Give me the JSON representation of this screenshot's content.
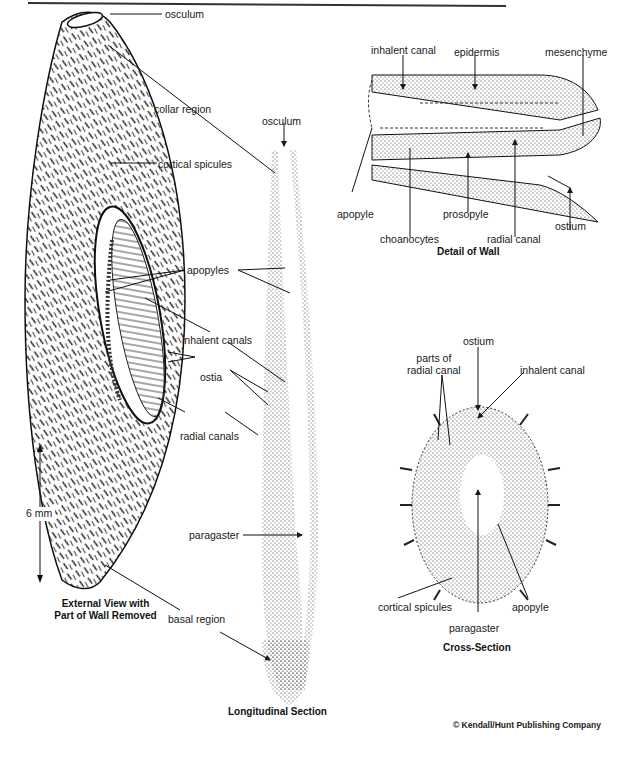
{
  "figure": {
    "panels": [
      {
        "id": "external-view",
        "caption_line1": "External View with",
        "caption_line2": "Part of Wall Removed",
        "scale_bar": "6 mm",
        "labels": [
          "osculum",
          "collar region",
          "cortical spicules",
          "apopyles",
          "inhalent canals",
          "ostia",
          "radial canals",
          "basal region"
        ]
      },
      {
        "id": "longitudinal-section",
        "caption": "Longitudinal Section",
        "labels": [
          "osculum",
          "paragaster"
        ]
      },
      {
        "id": "detail-of-wall",
        "caption": "Detail of Wall",
        "labels": [
          "inhalent canal",
          "epidermis",
          "mesenchyme",
          "apopyle",
          "choanocytes",
          "prosopyle",
          "radial canal",
          "ostium"
        ]
      },
      {
        "id": "cross-section",
        "caption": "Cross-Section",
        "labels": [
          "ostium",
          "parts of radial canal",
          "inhalent canal",
          "cortical spicules",
          "apopyle",
          "paragaster"
        ]
      }
    ],
    "copyright": "© Kendall/Hunt Publishing Company"
  },
  "labels": {
    "ext_osculum": "osculum",
    "collar_region": "collar region",
    "cortical_spicules": "cortical spicules",
    "apopyles": "apopyles",
    "inhalent_canals": "inhalent canals",
    "ostia": "ostia",
    "radial_canals": "radial canals",
    "basal_region": "basal region",
    "scale": "6 mm",
    "long_osculum": "osculum",
    "paragaster": "paragaster",
    "wall_inhalent_canal": "inhalent canal",
    "epidermis": "epidermis",
    "mesenchyme": "mesenchyme",
    "wall_apopyle": "apopyle",
    "choanocytes": "choanocytes",
    "prosopyle": "prosopyle",
    "wall_radial_canal": "radial canal",
    "wall_ostium": "ostium",
    "cs_ostium": "ostium",
    "cs_parts_line1": "parts of",
    "cs_parts_line2": "radial canal",
    "cs_inhalent_canal": "inhalent canal",
    "cs_cortical_spicules": "cortical  spicules",
    "cs_apopyle": "apopyle",
    "cs_paragaster": "paragaster"
  },
  "captions": {
    "external_1": "External View with",
    "external_2": "Part of Wall Removed",
    "longitudinal": "Longitudinal Section",
    "wall": "Detail of Wall",
    "cross": "Cross-Section"
  },
  "copyright": "© Kendall/Hunt Publishing Company",
  "colors": {
    "ink": "#1a1a1a",
    "paper": "#ffffff"
  }
}
